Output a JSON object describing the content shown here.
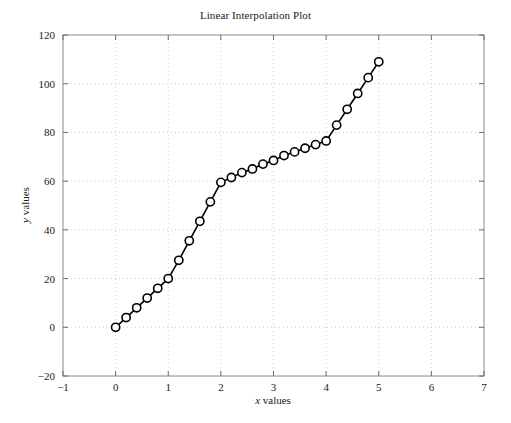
{
  "chart_data": {
    "type": "line",
    "title": "Linear Interpolation Plot",
    "xlabel": "x values",
    "ylabel": "y values",
    "xlim": [
      -1,
      7
    ],
    "ylim": [
      -20,
      120
    ],
    "xticks": [
      -1,
      0,
      1,
      2,
      3,
      4,
      5,
      6,
      7
    ],
    "xticklabels": [
      "−1",
      "0",
      "1",
      "2",
      "3",
      "4",
      "5",
      "6",
      "7"
    ],
    "yticks": [
      -20,
      0,
      20,
      40,
      60,
      80,
      100,
      120
    ],
    "yticklabels": [
      "−20",
      "0",
      "20",
      "40",
      "60",
      "80",
      "100",
      "120"
    ],
    "grid": true,
    "grid_style": "dotted",
    "legend": null,
    "marker": "open-circle",
    "line_color": "#000000",
    "marker_color": "#000000",
    "grid_color": "#c8c8c8",
    "axis_color": "#808080",
    "series": [
      {
        "name": "interpolated",
        "x": [
          0,
          0.2,
          0.4,
          0.6,
          0.8,
          1.0,
          1.2,
          1.4,
          1.6,
          1.8,
          2.0,
          2.2,
          2.4,
          2.6,
          2.8,
          3.0,
          3.2,
          3.4,
          3.6,
          3.8,
          4.0,
          4.2,
          4.4,
          4.6,
          4.8,
          5.0
        ],
        "y": [
          0,
          4,
          8,
          12,
          16,
          20,
          27.5,
          35.5,
          43.5,
          51.5,
          59.5,
          61.5,
          63.5,
          65,
          67,
          68.5,
          70.5,
          72,
          73.5,
          75,
          76.5,
          83,
          89.5,
          96,
          102.5,
          109
        ]
      }
    ]
  }
}
